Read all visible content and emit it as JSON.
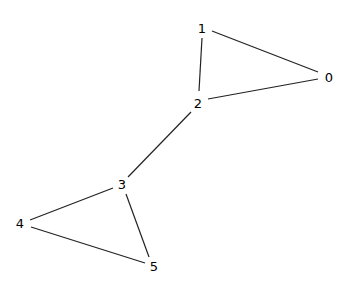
{
  "graph": {
    "nodes": [
      {
        "id": "0",
        "label": "0",
        "x": 329,
        "y": 77
      },
      {
        "id": "1",
        "label": "1",
        "x": 202,
        "y": 28
      },
      {
        "id": "2",
        "label": "2",
        "x": 198,
        "y": 103
      },
      {
        "id": "3",
        "label": "3",
        "x": 122,
        "y": 184
      },
      {
        "id": "4",
        "label": "4",
        "x": 20,
        "y": 223
      },
      {
        "id": "5",
        "label": "5",
        "x": 154,
        "y": 266
      }
    ],
    "edges": [
      {
        "source": "1",
        "target": "0",
        "x1": 212,
        "y1": 31,
        "x2": 318,
        "y2": 72
      },
      {
        "source": "1",
        "target": "2",
        "x1": 202,
        "y1": 38,
        "x2": 199,
        "y2": 91
      },
      {
        "source": "2",
        "target": "0",
        "x1": 208,
        "y1": 99,
        "x2": 318,
        "y2": 79
      },
      {
        "source": "2",
        "target": "3",
        "x1": 191,
        "y1": 112,
        "x2": 128,
        "y2": 177
      },
      {
        "source": "3",
        "target": "4",
        "x1": 113,
        "y1": 188,
        "x2": 30,
        "y2": 220
      },
      {
        "source": "3",
        "target": "5",
        "x1": 126,
        "y1": 194,
        "x2": 149,
        "y2": 257
      },
      {
        "source": "4",
        "target": "5",
        "x1": 31,
        "y1": 227,
        "x2": 145,
        "y2": 263
      }
    ]
  }
}
